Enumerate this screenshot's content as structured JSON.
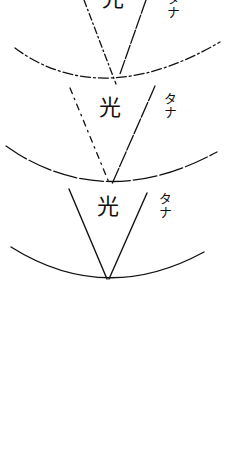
{
  "diagram": {
    "ink_color": "#111111",
    "background_color": "#ffffff",
    "sections": [
      {
        "id": "top",
        "cone_label": "光",
        "side_label": "タナ",
        "line_style": "dash-dot"
      },
      {
        "id": "middle",
        "cone_label": "光",
        "side_label": "タナ",
        "line_style": "dashed"
      },
      {
        "id": "bottom",
        "cone_label": "光",
        "side_label": "タナ",
        "line_style": "solid"
      }
    ]
  }
}
